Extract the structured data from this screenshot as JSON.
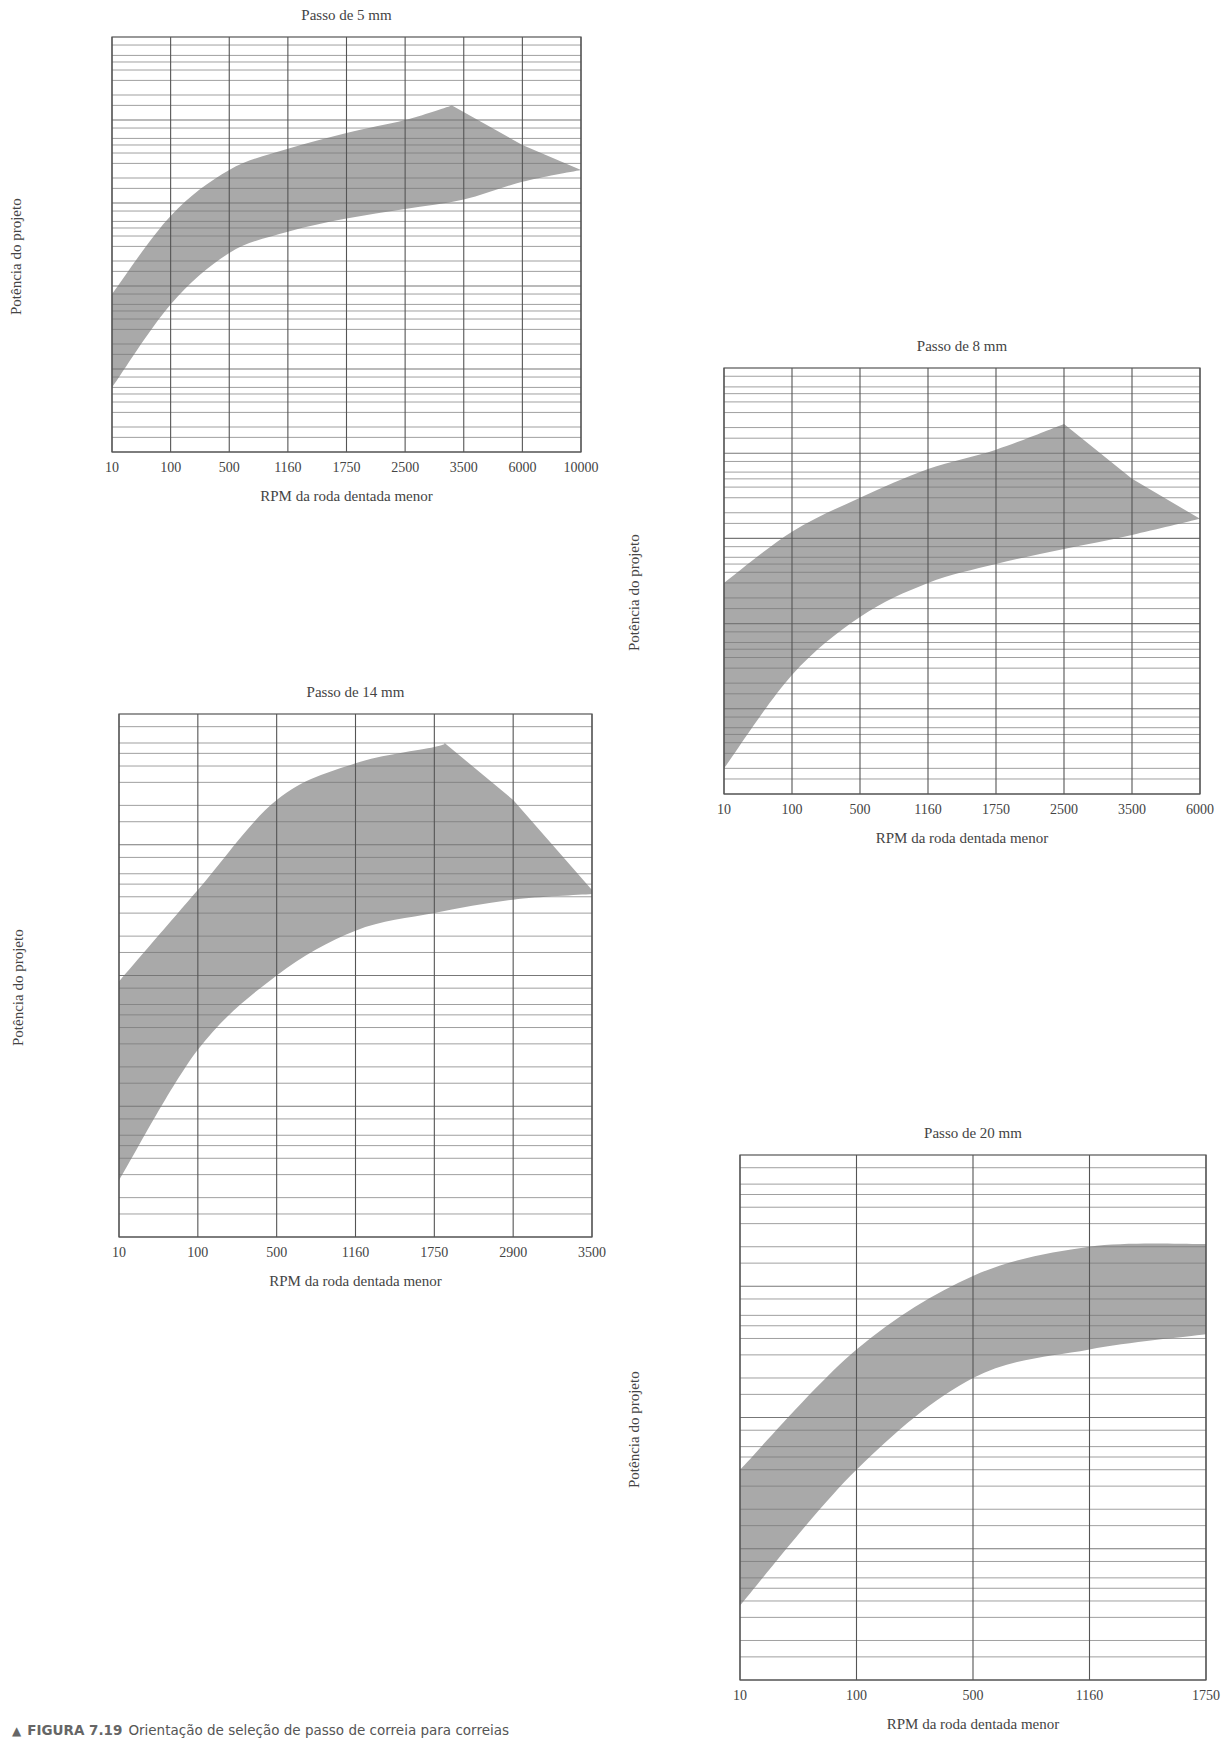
{
  "caption": {
    "marker": "▲",
    "figure_label": "FIGURA 7.19",
    "text": "Orientação de seleção de passo de correia para correias",
    "text_line2": "síncronas"
  },
  "colors": {
    "band": "#a9a9a9",
    "grid": "#555555",
    "minor_grid": "#777777",
    "text": "#444444"
  },
  "chart_data": [
    {
      "type": "area",
      "title": "Passo de 5 mm",
      "xlabel": "RPM da roda dentada menor",
      "ylabel": "Potência do projeto",
      "x_ticks": [
        "10",
        "100",
        "500",
        "1160",
        "1750",
        "2500",
        "3500",
        "6000",
        "10000"
      ],
      "y_ticks_outer": [
        "100",
        "10",
        "1",
        "0,1",
        "0,01",
        "0,001"
      ],
      "y_ticks_inner": [
        "100",
        "60",
        "40",
        "20",
        "10",
        "6",
        "4",
        "2",
        "1,0",
        "0,6",
        "0,4",
        "0,2",
        "0,10",
        "0,06",
        "0,04",
        "0,02",
        "0,010",
        "0,006",
        "0,004",
        "0,002"
      ],
      "ylim": [
        0.001,
        100
      ],
      "yscale": "log",
      "grid": true,
      "series": [
        {
          "name": "upper",
          "x": [
            "10",
            "100",
            "500",
            "1160",
            "1750",
            "2500",
            "3300",
            "6000",
            "10000"
          ],
          "values": [
            0.08,
            0.7,
            2.5,
            4.5,
            7,
            10,
            15,
            5,
            2.5
          ]
        },
        {
          "name": "lower",
          "x": [
            "10",
            "100",
            "500",
            "1160",
            "1750",
            "2500",
            "3500",
            "6000",
            "10000"
          ],
          "values": [
            0.006,
            0.06,
            0.25,
            0.45,
            0.65,
            0.85,
            1.1,
            1.8,
            2.5
          ]
        }
      ]
    },
    {
      "type": "area",
      "title": "Passo de 8 mm",
      "xlabel": "RPM da roda dentada menor",
      "ylabel": "Potência do projeto",
      "x_ticks": [
        "10",
        "100",
        "500",
        "1160",
        "1750",
        "2500",
        "3500",
        "6000"
      ],
      "y_ticks_outer": [
        "1000",
        "100",
        "10",
        "1",
        "0,1",
        "0,01"
      ],
      "y_ticks_inner": [
        "1000",
        "600",
        "400",
        "200",
        "100",
        "60",
        "40",
        "20",
        "10",
        "6",
        "4",
        "2",
        "1,0",
        "0,6",
        "0,4",
        "0,2",
        "0,10",
        "0,06",
        "0,04",
        "0,02"
      ],
      "ylim": [
        0.01,
        1000
      ],
      "yscale": "log",
      "grid": true,
      "series": [
        {
          "name": "upper",
          "x": [
            "10",
            "100",
            "500",
            "1160",
            "1750",
            "2500",
            "3500",
            "6000"
          ],
          "values": [
            3,
            12,
            30,
            65,
            110,
            220,
            50,
            17
          ]
        },
        {
          "name": "lower",
          "x": [
            "10",
            "100",
            "500",
            "1160",
            "1750",
            "2500",
            "3500",
            "6000"
          ],
          "values": [
            0.02,
            0.25,
            1.2,
            3,
            5,
            7.5,
            11,
            17
          ]
        }
      ]
    },
    {
      "type": "area",
      "title": "Passo de 14 mm",
      "xlabel": "RPM da roda dentada menor",
      "ylabel": "Potência do projeto",
      "x_ticks": [
        "10",
        "100",
        "500",
        "1160",
        "1750",
        "2900",
        "3500"
      ],
      "y_ticks_outer": [
        "1000",
        "100",
        "10",
        "1",
        "0,1"
      ],
      "y_ticks_inner": [
        "1000",
        "600",
        "400",
        "200",
        "100",
        "60",
        "40",
        "20",
        "10",
        "6",
        "4",
        "2",
        "1,0",
        "0,6",
        "0,4",
        "0,2"
      ],
      "ylim": [
        0.1,
        1000
      ],
      "yscale": "log",
      "grid": true,
      "series": [
        {
          "name": "upper",
          "x": [
            "10",
            "100",
            "500",
            "1160",
            "1750",
            "1900",
            "2900",
            "3500"
          ],
          "values": [
            9,
            45,
            220,
            420,
            560,
            600,
            220,
            45
          ]
        },
        {
          "name": "lower",
          "x": [
            "10",
            "100",
            "500",
            "1160",
            "1750",
            "2900",
            "3500"
          ],
          "values": [
            0.27,
            2.7,
            10,
            22,
            30,
            38,
            42
          ]
        }
      ]
    },
    {
      "type": "area",
      "title": "Passo de 20 mm",
      "xlabel": "RPM da roda dentada menor",
      "ylabel": "Potência do projeto",
      "x_ticks": [
        "10",
        "100",
        "500",
        "1160",
        "1750"
      ],
      "y_ticks_outer": [
        "10000",
        "1000",
        "100",
        "10",
        "1"
      ],
      "y_ticks_inner": [
        "10000",
        "6000",
        "4000",
        "2000",
        "1000",
        "600",
        "400",
        "200",
        "100",
        "60",
        "40",
        "20",
        "10",
        "6",
        "4",
        "2"
      ],
      "ylim": [
        1,
        10000
      ],
      "yscale": "log",
      "grid": true,
      "series": [
        {
          "name": "upper",
          "x": [
            "10",
            "100",
            "500",
            "1160",
            "1750"
          ],
          "values": [
            40,
            330,
            1200,
            2000,
            2100
          ]
        },
        {
          "name": "lower",
          "x": [
            "10",
            "100",
            "500",
            "1160",
            "1750"
          ],
          "values": [
            3.7,
            40,
            200,
            330,
            430
          ]
        }
      ]
    }
  ]
}
